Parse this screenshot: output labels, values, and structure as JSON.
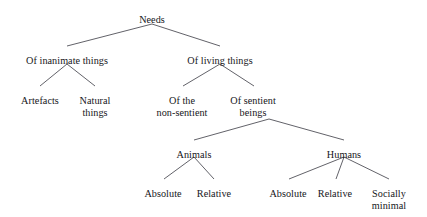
{
  "diagram": {
    "type": "hierarchical-tree",
    "background_color": "#ffffff",
    "line_color": "#3a3a42",
    "text_color": "#16161a",
    "nodes": [
      {
        "id": "needs",
        "label": "Needs",
        "x": 152,
        "y": 14,
        "level": 0
      },
      {
        "id": "inanimate",
        "label": "Of inanimate things",
        "x": 67,
        "y": 55,
        "level": 1
      },
      {
        "id": "living",
        "label": "Of living things",
        "x": 220,
        "y": 55,
        "level": 1
      },
      {
        "id": "artefacts",
        "label": "Artefacts",
        "x": 40,
        "y": 95,
        "level": 2
      },
      {
        "id": "natural-things",
        "label": "Natural\nthings",
        "x": 95,
        "y": 95,
        "level": 2
      },
      {
        "id": "non-sentient",
        "label": "Of the\nnon-sentient",
        "x": 182,
        "y": 95,
        "level": 2
      },
      {
        "id": "sentient-beings",
        "label": "Of sentient\nbeings",
        "x": 253,
        "y": 95,
        "level": 2
      },
      {
        "id": "animals",
        "label": "Animals",
        "x": 194,
        "y": 149,
        "level": 3
      },
      {
        "id": "humans",
        "label": "Humans",
        "x": 344,
        "y": 149,
        "level": 3
      },
      {
        "id": "animals-absolute",
        "label": "Absolute",
        "x": 163,
        "y": 188,
        "level": 4
      },
      {
        "id": "animals-relative",
        "label": "Relative",
        "x": 214,
        "y": 188,
        "level": 4
      },
      {
        "id": "humans-absolute",
        "label": "Absolute",
        "x": 288,
        "y": 188,
        "level": 4
      },
      {
        "id": "humans-relative",
        "label": "Relative",
        "x": 335,
        "y": 188,
        "level": 4
      },
      {
        "id": "socially-minimal",
        "label": "Socially\nminimal",
        "x": 389,
        "y": 188,
        "level": 4
      }
    ],
    "edges": [
      {
        "id": "edge-needs-inanimate",
        "from": "needs",
        "to": "inanimate",
        "x1": 152,
        "y1": 24,
        "x2": 67,
        "y2": 46
      },
      {
        "id": "edge-needs-living",
        "from": "needs",
        "to": "living",
        "x1": 152,
        "y1": 24,
        "x2": 220,
        "y2": 46
      },
      {
        "id": "edge-inanimate-artefacts",
        "from": "inanimate",
        "to": "artefacts",
        "x1": 67,
        "y1": 64,
        "x2": 40,
        "y2": 86
      },
      {
        "id": "edge-inanimate-natural",
        "from": "inanimate",
        "to": "natural-things",
        "x1": 67,
        "y1": 64,
        "x2": 95,
        "y2": 86
      },
      {
        "id": "edge-living-nonsentient",
        "from": "living",
        "to": "non-sentient",
        "x1": 220,
        "y1": 64,
        "x2": 183,
        "y2": 86
      },
      {
        "id": "edge-living-sentient",
        "from": "living",
        "to": "sentient-beings",
        "x1": 220,
        "y1": 64,
        "x2": 254,
        "y2": 86
      },
      {
        "id": "edge-sentient-animals",
        "from": "sentient-beings",
        "to": "animals",
        "x1": 269,
        "y1": 119,
        "x2": 194,
        "y2": 140
      },
      {
        "id": "edge-sentient-humans",
        "from": "sentient-beings",
        "to": "humans",
        "x1": 269,
        "y1": 119,
        "x2": 344,
        "y2": 140
      },
      {
        "id": "edge-animals-absolute",
        "from": "animals",
        "to": "animals-absolute",
        "x1": 194,
        "y1": 157,
        "x2": 164,
        "y2": 179
      },
      {
        "id": "edge-animals-relative",
        "from": "animals",
        "to": "animals-relative",
        "x1": 194,
        "y1": 157,
        "x2": 214,
        "y2": 179
      },
      {
        "id": "edge-humans-absolute",
        "from": "humans",
        "to": "humans-absolute",
        "x1": 344,
        "y1": 157,
        "x2": 289,
        "y2": 179
      },
      {
        "id": "edge-humans-relative",
        "from": "humans",
        "to": "humans-relative",
        "x1": 344,
        "y1": 157,
        "x2": 336,
        "y2": 179
      },
      {
        "id": "edge-humans-socially-minimal",
        "from": "humans",
        "to": "socially-minimal",
        "x1": 344,
        "y1": 157,
        "x2": 389,
        "y2": 179
      }
    ]
  }
}
